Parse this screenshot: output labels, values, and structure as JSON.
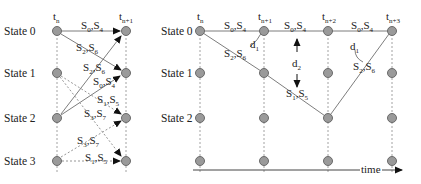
{
  "left_diagram": {
    "time_labels": [
      {
        "base": "t",
        "sub": "n"
      },
      {
        "base": "t",
        "sub": "n+1"
      }
    ],
    "states": [
      "State 0",
      "State 1",
      "State 2",
      "State 3"
    ],
    "transitions": [
      {
        "from": "State 0",
        "to": "State 0",
        "label": "S0,S4",
        "style": "solid"
      },
      {
        "from": "State 0",
        "to": "State 1",
        "label": "S2,S6",
        "style": "solid"
      },
      {
        "from": "State 2",
        "to": "State 0",
        "label": "S2,S6",
        "style": "solid"
      },
      {
        "from": "State 2",
        "to": "State 1",
        "label": "S0,S4",
        "style": "solid"
      },
      {
        "from": "State 1",
        "to": "State 2",
        "label": "S1,S5",
        "style": "dashed"
      },
      {
        "from": "State 1",
        "to": "State 3",
        "label": "S3,S7",
        "style": "dashed"
      },
      {
        "from": "State 3",
        "to": "State 2",
        "label": "S3,S7",
        "style": "dashed"
      },
      {
        "from": "State 3",
        "to": "State 3",
        "label": "S1,S5",
        "style": "dashed"
      }
    ]
  },
  "right_diagram": {
    "time_labels": [
      {
        "base": "t",
        "sub": "n"
      },
      {
        "base": "t",
        "sub": "n+1"
      },
      {
        "base": "t",
        "sub": "n+2"
      },
      {
        "base": "t",
        "sub": "n+3"
      }
    ],
    "states": [
      "State 0",
      "State 1",
      "State 2"
    ],
    "path_labels": [
      {
        "label": "S0,S4",
        "between": "tn-tn+1",
        "row": "State 0"
      },
      {
        "label": "S0,S4",
        "between": "tn+1-tn+2",
        "row": "State 0"
      },
      {
        "label": "S0,S4",
        "between": "tn+2-tn+3",
        "row": "State 0"
      },
      {
        "label": "S2,S6",
        "between": "tn-tn+1",
        "row": "diagonal"
      },
      {
        "label": "S1,S5",
        "between": "tn+1-tn+2",
        "row": "diagonal"
      },
      {
        "label": "S2,S6",
        "between": "tn+2-tn+3",
        "row": "diagonal"
      }
    ],
    "distance_labels": [
      {
        "base": "d",
        "sub": "1"
      },
      {
        "base": "d",
        "sub": "2"
      },
      {
        "base": "d",
        "sub": "1"
      }
    ],
    "axis_label": "time"
  }
}
